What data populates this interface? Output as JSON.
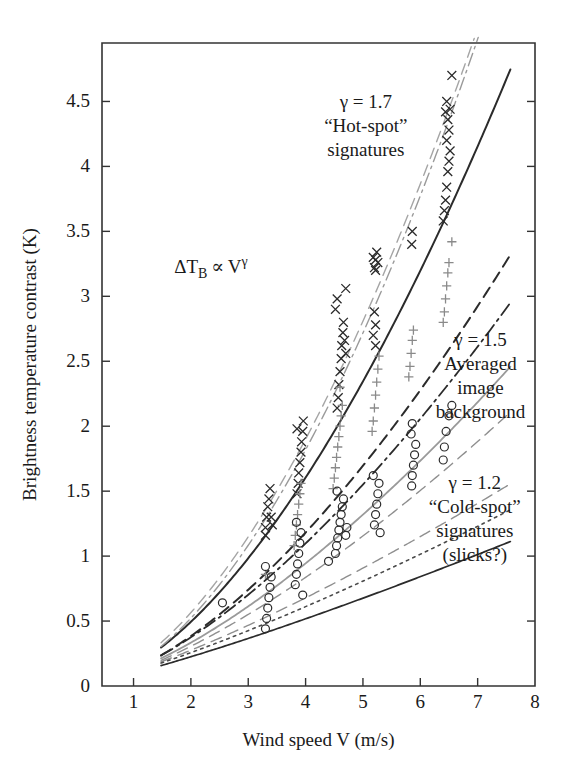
{
  "figure": {
    "background_color": "#ffffff",
    "ink_color": "#1a1a1a"
  },
  "chart_data": {
    "type": "scatter",
    "title": "",
    "subtitle": "",
    "xlabel": "Wind speed V (m/s)",
    "ylabel": "Brightness temperature contrast (K)",
    "xlim": [
      0.45,
      8.0
    ],
    "ylim": [
      0,
      4.95
    ],
    "xticks": [
      1,
      2,
      3,
      4,
      5,
      6,
      7,
      8
    ],
    "xticklabels": [
      "1",
      "2",
      "3",
      "4",
      "5",
      "6",
      "7",
      "8"
    ],
    "yticks": [
      0,
      0.5,
      1,
      1.5,
      2,
      2.5,
      3,
      3.5,
      4,
      4.5
    ],
    "yticklabels": [
      "0",
      "0.5",
      "1",
      "1.5",
      "2",
      "2.5",
      "3",
      "3.5",
      "4",
      "4.5"
    ],
    "grid": false,
    "legend_position": "none",
    "relation": "dTB proportional to V^gamma",
    "annotations": [
      {
        "name": "power-law-formula",
        "text": "ΔTB ∝ Vγ",
        "display": "ΔT_B ∝ V^γ",
        "x": 2.35,
        "y": 3.18
      },
      {
        "name": "hot-spot-label",
        "lines": [
          "γ = 1.7",
          "“Hot-spot”",
          "signatures"
        ],
        "x": 5.05,
        "y": 4.45
      },
      {
        "name": "averaged-background-label",
        "lines": [
          "γ = 1.5",
          "Averaged",
          "image",
          "background"
        ],
        "x": 7.05,
        "y": 2.62
      },
      {
        "name": "cold-spot-label",
        "lines": [
          "γ = 1.2",
          "“Cold-spot”",
          "signatures",
          "(slicks?)"
        ],
        "x": 6.95,
        "y": 1.52
      }
    ],
    "series": [
      {
        "name": "Hot-spot signatures",
        "marker": "x",
        "gamma": 1.7,
        "color": "#2b2b2b",
        "points": [
          [
            3.3,
            1.16
          ],
          [
            3.3,
            1.22
          ],
          [
            3.32,
            1.3
          ],
          [
            3.34,
            1.38
          ],
          [
            3.36,
            1.44
          ],
          [
            3.38,
            1.52
          ],
          [
            3.4,
            1.3
          ],
          [
            3.42,
            1.24
          ],
          [
            3.85,
            1.48
          ],
          [
            3.87,
            1.56
          ],
          [
            3.88,
            1.64
          ],
          [
            3.9,
            1.72
          ],
          [
            3.92,
            1.8
          ],
          [
            3.93,
            1.88
          ],
          [
            3.95,
            1.96
          ],
          [
            3.96,
            2.04
          ],
          [
            3.85,
            1.98
          ],
          [
            4.55,
            2.14
          ],
          [
            4.57,
            2.22
          ],
          [
            4.58,
            2.32
          ],
          [
            4.6,
            2.42
          ],
          [
            4.62,
            2.52
          ],
          [
            4.63,
            2.62
          ],
          [
            4.65,
            2.72
          ],
          [
            4.66,
            2.8
          ],
          [
            4.68,
            2.66
          ],
          [
            4.7,
            2.56
          ],
          [
            4.52,
            2.9
          ],
          [
            4.55,
            2.98
          ],
          [
            5.2,
            3.22
          ],
          [
            5.22,
            3.28
          ],
          [
            5.24,
            3.34
          ],
          [
            5.18,
            3.3
          ],
          [
            5.26,
            3.26
          ],
          [
            5.22,
            3.2
          ],
          [
            5.85,
            3.4
          ],
          [
            5.86,
            3.5
          ],
          [
            6.4,
            3.58
          ],
          [
            6.42,
            3.66
          ],
          [
            6.44,
            3.74
          ],
          [
            6.46,
            3.84
          ],
          [
            6.48,
            3.96
          ],
          [
            6.5,
            4.04
          ],
          [
            6.52,
            4.12
          ],
          [
            6.46,
            4.2
          ],
          [
            6.5,
            4.28
          ],
          [
            6.48,
            4.36
          ],
          [
            6.52,
            4.44
          ],
          [
            6.44,
            4.42
          ],
          [
            6.46,
            4.5
          ],
          [
            6.55,
            4.7
          ],
          [
            5.2,
            2.88
          ],
          [
            5.22,
            2.78
          ],
          [
            5.18,
            2.7
          ],
          [
            5.22,
            2.62
          ],
          [
            4.7,
            3.06
          ]
        ]
      },
      {
        "name": "Averaged image background",
        "marker": "+",
        "gamma": 1.5,
        "color": "#8a8a8a",
        "points": [
          [
            3.3,
            0.86
          ],
          [
            3.82,
            1.16
          ],
          [
            3.84,
            1.24
          ],
          [
            3.86,
            1.32
          ],
          [
            3.88,
            1.4
          ],
          [
            3.9,
            1.48
          ],
          [
            3.92,
            1.56
          ],
          [
            4.5,
            1.6
          ],
          [
            4.52,
            1.68
          ],
          [
            4.54,
            1.76
          ],
          [
            4.56,
            1.84
          ],
          [
            4.58,
            1.92
          ],
          [
            4.6,
            2.0
          ],
          [
            4.62,
            2.08
          ],
          [
            4.64,
            2.16
          ],
          [
            4.48,
            1.52
          ],
          [
            5.18,
            2.04
          ],
          [
            5.2,
            2.14
          ],
          [
            5.22,
            2.24
          ],
          [
            5.24,
            2.34
          ],
          [
            5.26,
            2.44
          ],
          [
            5.16,
            1.96
          ],
          [
            5.82,
            2.46
          ],
          [
            5.84,
            2.56
          ],
          [
            5.86,
            2.66
          ],
          [
            5.88,
            2.74
          ],
          [
            5.8,
            2.38
          ],
          [
            6.42,
            2.88
          ],
          [
            6.44,
            2.98
          ],
          [
            6.46,
            3.08
          ],
          [
            6.48,
            3.18
          ],
          [
            6.5,
            3.26
          ],
          [
            6.4,
            2.8
          ],
          [
            6.55,
            3.42
          ],
          [
            4.6,
            2.3
          ],
          [
            5.28,
            2.54
          ],
          [
            3.8,
            1.08
          ]
        ]
      },
      {
        "name": "Cold-spot signatures (slicks?)",
        "marker": "o",
        "gamma": 1.2,
        "color": "#2b2b2b",
        "points": [
          [
            2.55,
            0.64
          ],
          [
            3.3,
            0.44
          ],
          [
            3.32,
            0.52
          ],
          [
            3.34,
            0.6
          ],
          [
            3.36,
            0.68
          ],
          [
            3.38,
            0.76
          ],
          [
            3.4,
            0.84
          ],
          [
            3.3,
            0.92
          ],
          [
            3.82,
            0.78
          ],
          [
            3.84,
            0.86
          ],
          [
            3.86,
            0.94
          ],
          [
            3.88,
            1.02
          ],
          [
            3.9,
            1.1
          ],
          [
            3.92,
            1.18
          ],
          [
            3.84,
            1.26
          ],
          [
            4.52,
            1.02
          ],
          [
            4.54,
            1.08
          ],
          [
            4.56,
            1.14
          ],
          [
            4.58,
            1.2
          ],
          [
            4.6,
            1.26
          ],
          [
            4.62,
            1.32
          ],
          [
            4.64,
            1.38
          ],
          [
            4.66,
            1.44
          ],
          [
            4.55,
            1.5
          ],
          [
            4.7,
            1.16
          ],
          [
            4.72,
            1.22
          ],
          [
            5.2,
            1.24
          ],
          [
            5.22,
            1.32
          ],
          [
            5.24,
            1.4
          ],
          [
            5.26,
            1.48
          ],
          [
            5.28,
            1.56
          ],
          [
            5.18,
            1.62
          ],
          [
            5.85,
            1.54
          ],
          [
            5.86,
            1.62
          ],
          [
            5.88,
            1.7
          ],
          [
            5.9,
            1.78
          ],
          [
            5.92,
            1.86
          ],
          [
            5.84,
            1.94
          ],
          [
            5.86,
            2.02
          ],
          [
            6.4,
            1.74
          ],
          [
            6.42,
            1.84
          ],
          [
            6.5,
            2.08
          ],
          [
            6.55,
            2.16
          ],
          [
            6.45,
            1.96
          ],
          [
            5.3,
            1.18
          ],
          [
            4.4,
            0.96
          ],
          [
            3.95,
            0.7
          ]
        ]
      }
    ],
    "fit_curves": [
      {
        "name": "hot-spot-main",
        "gamma": 1.7,
        "coef": 0.152,
        "style": "solid",
        "color": "#2b2b2b",
        "width": 2.0
      },
      {
        "name": "hot-spot-upper-dashdot",
        "gamma": 1.8,
        "coef": 0.15,
        "style": "dashdot",
        "color": "#9a9a9a",
        "width": 1.4
      },
      {
        "name": "hot-spot-upper-dash",
        "gamma": 1.75,
        "coef": 0.168,
        "style": "dash",
        "color": "#a5a5a5",
        "width": 1.4
      },
      {
        "name": "mid-dash-dark",
        "gamma": 1.62,
        "coef": 0.125,
        "style": "dash",
        "color": "#2b2b2b",
        "width": 2.0
      },
      {
        "name": "mid-dashdot-dark",
        "gamma": 1.55,
        "coef": 0.128,
        "style": "dashdot",
        "color": "#2b2b2b",
        "width": 1.8
      },
      {
        "name": "averaged-main",
        "gamma": 1.5,
        "coef": 0.118,
        "style": "solid",
        "color": "#9a9a9a",
        "width": 1.8
      },
      {
        "name": "averaged-dash",
        "gamma": 1.45,
        "coef": 0.112,
        "style": "dash",
        "color": "#8f8f8f",
        "width": 1.4
      },
      {
        "name": "cold-spot-upper-dash",
        "gamma": 1.3,
        "coef": 0.112,
        "style": "dash",
        "color": "#8f8f8f",
        "width": 1.4
      },
      {
        "name": "cold-spot-dotted",
        "gamma": 1.25,
        "coef": 0.108,
        "style": "dot",
        "color": "#4a4a4a",
        "width": 1.6
      },
      {
        "name": "cold-spot-main",
        "gamma": 1.2,
        "coef": 0.098,
        "style": "solid",
        "color": "#2b2b2b",
        "width": 1.7
      }
    ]
  }
}
